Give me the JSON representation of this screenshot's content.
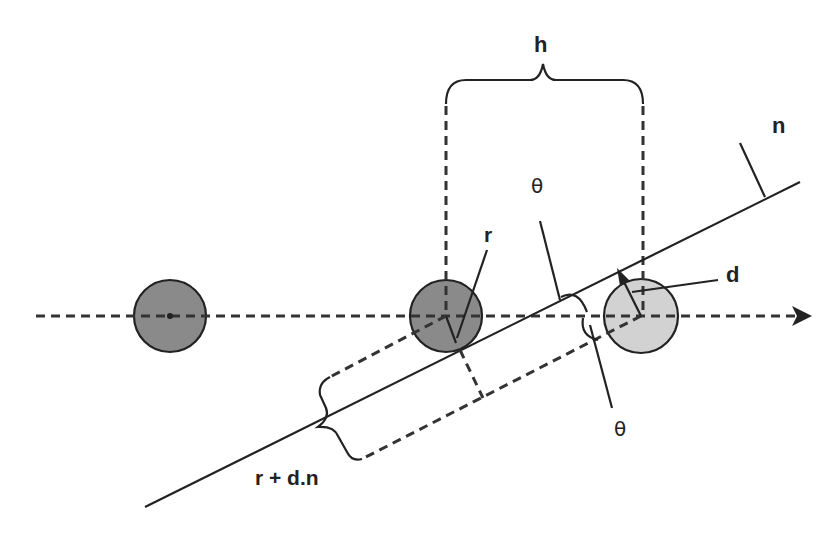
{
  "diagram": {
    "title": "",
    "colors": {
      "stroke": "#222222",
      "circle_dark": "#8a8a8a",
      "circle_light": "#d2d2d2",
      "background": "#ffffff"
    },
    "labels": {
      "h": "h",
      "n": "n",
      "theta_top": "θ",
      "theta_bottom": "θ",
      "r": "r",
      "d": "d",
      "r_plus_dn": "r + d.n"
    },
    "circles": [
      {
        "id": "left",
        "cx": 170,
        "cy": 316,
        "r": 36,
        "shade": "dark"
      },
      {
        "id": "middle",
        "cx": 446,
        "cy": 316,
        "r": 36,
        "shade": "dark"
      },
      {
        "id": "right",
        "cx": 641,
        "cy": 316,
        "r": 37,
        "shade": "light"
      }
    ],
    "axis": {
      "direction": "right",
      "style": "dashed arrow"
    },
    "plane_line": {
      "from": [
        145,
        507
      ],
      "to": [
        800,
        182
      ]
    }
  }
}
